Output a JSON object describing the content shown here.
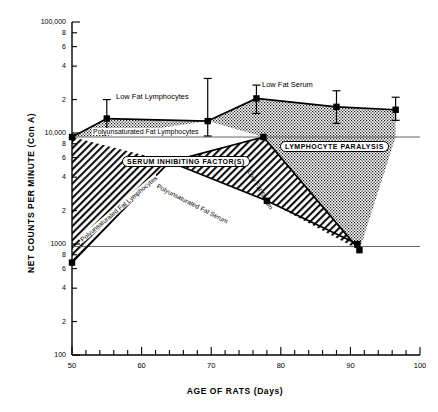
{
  "chart_data": {
    "type": "area",
    "title": "",
    "xlabel": "AGE OF RATS (Days)",
    "ylabel": "NET COUNTS PER MINUTE (Con A)",
    "xlim": [
      50,
      100
    ],
    "ylim": [
      100,
      100000
    ],
    "yscale": "log",
    "xscale": "linear",
    "grid": false,
    "legend": "inline-annotations",
    "xticks": [
      50,
      60,
      70,
      80,
      90,
      100
    ],
    "xtick_labels": [
      "50",
      "60",
      "70",
      "80",
      "90",
      "100"
    ],
    "ytick_labels": [
      "100,000",
      "8",
      "6",
      "4",
      "2",
      "10,000",
      "8",
      "6",
      "4",
      "2",
      "1000",
      "8",
      "6",
      "4",
      "2",
      "100"
    ],
    "yticks": [
      100000,
      80000,
      60000,
      40000,
      20000,
      10000,
      8000,
      6000,
      4000,
      2000,
      1000,
      800,
      600,
      400,
      200,
      100
    ],
    "reference_lines": [
      {
        "name": "upper-reference-line",
        "y": 9200
      },
      {
        "name": "lower-reference-line",
        "y": 950
      }
    ],
    "series": [
      {
        "name": "Low Fat Lymphocytes",
        "label": "Low Fat Lymphocytes",
        "fill": "stippled",
        "points": [
          {
            "x": 50,
            "y": 9200
          },
          {
            "x": 55,
            "y": 13500,
            "err_low": 10200,
            "err_high": 20000
          },
          {
            "x": 69.5,
            "y": 12800,
            "err_low": 9400,
            "err_high": 31000
          }
        ]
      },
      {
        "name": "Low Fat Serum",
        "label": "Low Fat Serum",
        "fill": "stippled",
        "points": [
          {
            "x": 69.5,
            "y": 12800
          },
          {
            "x": 76.5,
            "y": 20500,
            "err_low": 15000,
            "err_high": 27000
          },
          {
            "x": 88,
            "y": 17200,
            "err_low": 12200,
            "err_high": 24000
          },
          {
            "x": 96.5,
            "y": 16200,
            "err_low": 13000,
            "err_high": 21000
          }
        ]
      },
      {
        "name": "Polyunsaturated Fat Lymphocytes",
        "label": "Polyunsaturated Fat Lymphocytes",
        "fill": "hatched",
        "points": [
          {
            "x": 50,
            "y": 680
          },
          {
            "x": 64,
            "y": 5500
          },
          {
            "x": 77.5,
            "y": 9200
          }
        ]
      },
      {
        "name": "Polyunsaturated Fat Serum",
        "label": "Polyunsaturated Fat Serum",
        "fill": "hatched",
        "points": [
          {
            "x": 64,
            "y": 5500
          },
          {
            "x": 78,
            "y": 2450
          },
          {
            "x": 91,
            "y": 1000
          }
        ]
      },
      {
        "name": "Low Fat Serum descending",
        "label": "Low Fat Serum",
        "fill": "stippled",
        "points": [
          {
            "x": 77.5,
            "y": 9200
          },
          {
            "x": 91.3,
            "y": 880
          }
        ]
      }
    ],
    "annotations": [
      {
        "name": "serum-inhibiting-factors-label",
        "text": "SERUM INHIBITING FACTOR(S)",
        "boxed": true
      },
      {
        "name": "lymphocyte-paralysis-label",
        "text": "LYMPHOCYTE PARALYSIS",
        "boxed": true
      },
      {
        "name": "low-fat-lymphocytes-label",
        "text": "Low Fat Lymphocytes",
        "boxed": false
      },
      {
        "name": "low-fat-serum-label",
        "text": "Low Fat Serum",
        "boxed": false
      },
      {
        "name": "polyunsaturated-fat-lymphocytes-upper-label",
        "text": "Polyunsaturated Fat Lymphocytes",
        "boxed": false
      },
      {
        "name": "polyunsaturated-fat-lymphocytes-lower-label",
        "text": "Polyunsaturated Fat Lymphocytes",
        "boxed": false
      },
      {
        "name": "polyunsaturated-fat-serum-label",
        "text": "Polyunsaturated Fat Serum",
        "boxed": false
      },
      {
        "name": "low-fat-serum-descending-label",
        "text": "Low Fat Serum",
        "boxed": false
      }
    ]
  }
}
